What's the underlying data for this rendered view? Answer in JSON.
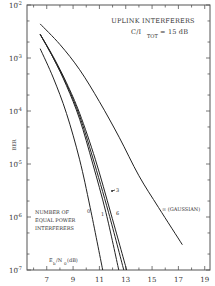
{
  "chart_data": {
    "type": "line",
    "title": "UPLINK INTERFERERS",
    "subtitle": "C/I_TOT = 15 dB",
    "xlabel": "E_b/N_0 (dB)",
    "ylabel": "BER",
    "x_scale": "linear",
    "y_scale": "log",
    "xlim": [
      5.5,
      19.4
    ],
    "ylim": [
      1e-07,
      0.01
    ],
    "x_ticks": [
      7,
      9,
      11,
      13,
      15,
      17,
      19
    ],
    "x_tick_labels": [
      "7",
      "9",
      "11",
      "13",
      "15",
      "17",
      "19"
    ],
    "y_ticks": [
      0.01,
      0.001,
      0.0001,
      1e-05,
      1e-06,
      1e-07
    ],
    "y_tick_labels": [
      {
        "base": "10",
        "exp": "-2"
      },
      {
        "base": "10",
        "exp": "-3"
      },
      {
        "base": "10",
        "exp": "-4"
      },
      {
        "base": "10",
        "exp": "-5"
      },
      {
        "base": "10",
        "exp": "-6"
      },
      {
        "base": "10",
        "exp": "-7"
      }
    ],
    "grid": false,
    "legend_title": [
      "NUMBER OF",
      "EQUAL POWER",
      "INTERFERERS"
    ],
    "series": [
      {
        "name": "0",
        "label": "0",
        "x": [
          6.5,
          7.5,
          8.5,
          9.5,
          10.3,
          11.25
        ],
        "y": [
          0.0015,
          0.00042,
          9e-05,
          1.2e-05,
          1.5e-06,
          1e-07
        ]
      },
      {
        "name": "1",
        "label": "1",
        "x": [
          6.5,
          7.5,
          8.5,
          9.5,
          10.5,
          11.5,
          12.47
        ],
        "y": [
          0.0028,
          0.001,
          0.0003,
          7e-05,
          1e-05,
          1.2e-06,
          1e-07
        ]
      },
      {
        "name": "3",
        "label": "3",
        "x": [
          6.5,
          7.5,
          8.5,
          9.5,
          10.5,
          11.7,
          12.85
        ],
        "y": [
          0.0028,
          0.001,
          0.00032,
          8e-05,
          1.3e-05,
          1.2e-06,
          1e-07
        ]
      },
      {
        "name": "6",
        "label": "6",
        "x": [
          6.5,
          7.5,
          8.5,
          9.5,
          10.7,
          11.9,
          13.07
        ],
        "y": [
          0.0028,
          0.00105,
          0.00034,
          9e-05,
          1.2e-05,
          1.1e-06,
          1e-07
        ]
      },
      {
        "name": "∞ (GAUSSIAN)",
        "label": "∞ (GAUSSIAN)",
        "x": [
          6.5,
          8.0,
          9.5,
          11.0,
          12.5,
          14.0,
          15.5,
          17.3
        ],
        "y": [
          0.0044,
          0.0018,
          0.0006,
          0.00015,
          3.2e-05,
          6e-06,
          1.5e-06,
          3e-07
        ]
      }
    ],
    "annotations": [
      "UPLINK INTERFERERS",
      "C/I_TOT = 15 dB",
      "NUMBER OF EQUAL POWER INTERFERERS",
      "E_b/N_0 (dB)"
    ]
  },
  "labels": {
    "title": "UPLINK INTERFERERS",
    "cit_prefix": "C/I",
    "cit_sub": "TOT",
    "cit_suffix": " = 15 dB",
    "ylabel": "BER",
    "xlabel_E": "E",
    "xlabel_b": "b",
    "xlabel_slash": "/N",
    "xlabel_0": "0",
    "xlabel_unit": " (dB)",
    "legend_line1": "NUMBER OF",
    "legend_line2": "EQUAL POWER",
    "legend_line3": "INTERFERERS",
    "label_0": "0",
    "label_1": "1",
    "label_3": "3",
    "label_6": "6",
    "label_gauss": "∞ (GAUSSIAN)"
  }
}
